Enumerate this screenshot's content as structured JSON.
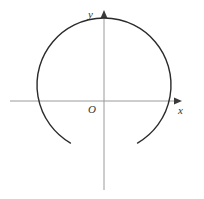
{
  "figure": {
    "background_color": "#ffffff",
    "width": 204,
    "height": 199
  },
  "labels": {
    "y_axis": "y",
    "x_axis": "x",
    "origin": "O"
  },
  "colors": {
    "axis": "#9a9a9a",
    "axis_arrow": "#3a3a3a",
    "curve": "#2b2b2b",
    "label_text": "#333333",
    "background": "#ffffff"
  },
  "chart_data": {
    "type": "line",
    "title": "",
    "xlabel": "x",
    "ylabel": "y",
    "grid": false,
    "legend": null,
    "origin_label": "O",
    "axes": {
      "x_axis": {
        "orientation": "horizontal",
        "pixel_y": 101,
        "pixel_x_start": 10,
        "pixel_x_end": 182,
        "arrow_at": "end",
        "label": "x"
      },
      "y_axis": {
        "orientation": "vertical",
        "pixel_x": 104,
        "pixel_y_start": 190,
        "pixel_y_end": 12,
        "arrow_at": "top",
        "label": "y"
      }
    },
    "curves": [
      {
        "name": "major-circular-arc",
        "shape": "circle_arc",
        "closed": false,
        "center_px": [
          104,
          85
        ],
        "radius_px": 67,
        "start_angle_deg": 240,
        "end_angle_deg": -60,
        "sweep_deg": 300,
        "open_gap_at": "top",
        "description": "Major arc of a circle centred just above the origin, open across the top; the arc dips below the x-axis and its lowest point lies on the negative y-axis.",
        "endpoints_px": [
          [
            37,
            48
          ],
          [
            172,
            48
          ]
        ],
        "lowest_point_px": [
          104,
          152
        ],
        "x_axis_intersections_px": [
          [
            33,
            101
          ],
          [
            175,
            101
          ]
        ],
        "stroke_color": "#2b2b2b",
        "stroke_width": 1.4
      }
    ],
    "xlim": [
      10,
      182
    ],
    "ylim": [
      190,
      12
    ]
  }
}
